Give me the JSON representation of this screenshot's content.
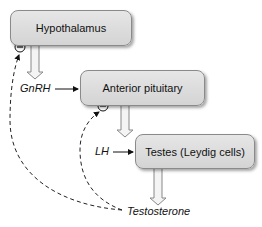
{
  "diagram": {
    "nodes": [
      {
        "id": "hypothalamus",
        "label": "Hypothalamus"
      },
      {
        "id": "anterior_pituitary",
        "label": "Anterior pituitary"
      },
      {
        "id": "testes",
        "label": "Testes (Leydig cells)"
      }
    ],
    "hormones": {
      "gnrh": "GnRH",
      "lh": "LH",
      "testosterone": "Testosterone"
    },
    "feedback_symbol": "−",
    "edges": [
      {
        "from": "hypothalamus",
        "to": "GnRH",
        "type": "secretion"
      },
      {
        "from": "GnRH",
        "to": "anterior_pituitary",
        "type": "stimulation"
      },
      {
        "from": "anterior_pituitary",
        "to": "LH",
        "type": "secretion"
      },
      {
        "from": "LH",
        "to": "testes",
        "type": "stimulation"
      },
      {
        "from": "testes",
        "to": "Testosterone",
        "type": "secretion"
      },
      {
        "from": "Testosterone",
        "to": "hypothalamus",
        "type": "negative-feedback"
      },
      {
        "from": "Testosterone",
        "to": "anterior_pituitary",
        "type": "negative-feedback"
      }
    ]
  }
}
